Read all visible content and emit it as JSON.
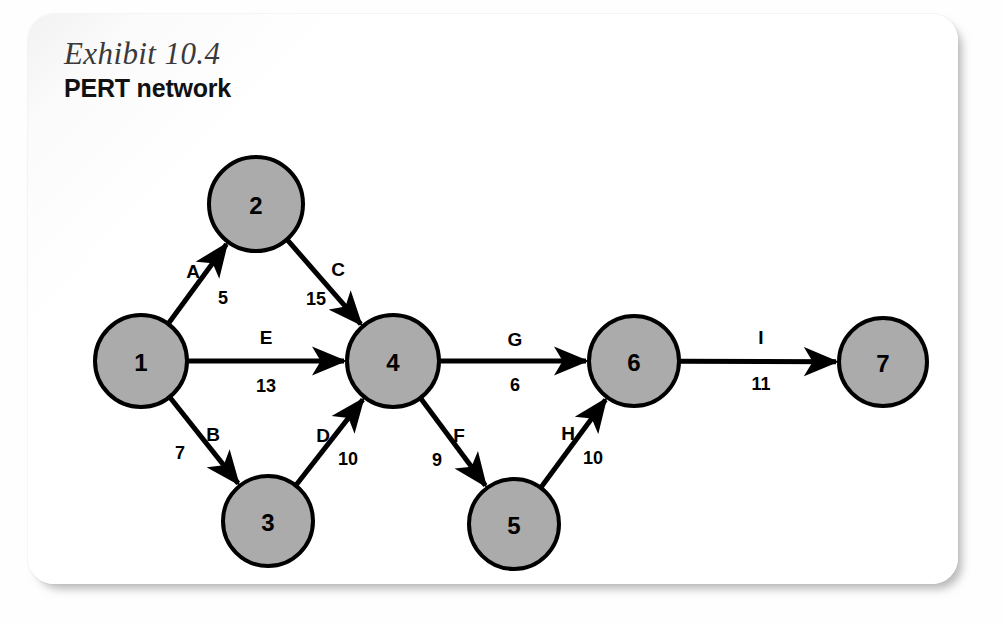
{
  "exhibit": {
    "number_label": "Exhibit 10.4",
    "title": "PERT network"
  },
  "colors": {
    "node_fill": "#ababab",
    "node_stroke": "#000000",
    "edge_stroke": "#000000",
    "panel_background": "#ffffff",
    "text": "#000000",
    "exhibit_label_text": "#3a3a3a"
  },
  "chart_data": {
    "type": "diagram",
    "subtype": "pert-network",
    "title": "PERT network",
    "nodes": [
      {
        "id": "1",
        "label": "1",
        "cx": 113,
        "cy": 347,
        "r": 46
      },
      {
        "id": "2",
        "label": "2",
        "cx": 228,
        "cy": 190,
        "r": 47
      },
      {
        "id": "3",
        "label": "3",
        "cx": 240,
        "cy": 507,
        "r": 45
      },
      {
        "id": "4",
        "label": "4",
        "cx": 365,
        "cy": 347,
        "r": 46
      },
      {
        "id": "5",
        "label": "5",
        "cx": 486,
        "cy": 510,
        "r": 45
      },
      {
        "id": "6",
        "label": "6",
        "cx": 606,
        "cy": 347,
        "r": 45
      },
      {
        "id": "7",
        "label": "7",
        "cx": 855,
        "cy": 348,
        "r": 44
      }
    ],
    "edges": [
      {
        "activity": "A",
        "duration": "5",
        "from": "1",
        "to": "2",
        "activity_pos": {
          "x": 165,
          "y": 257
        },
        "duration_pos": {
          "x": 195,
          "y": 284
        }
      },
      {
        "activity": "C",
        "duration": "15",
        "from": "2",
        "to": "4",
        "activity_pos": {
          "x": 310,
          "y": 255
        },
        "duration_pos": {
          "x": 288,
          "y": 285
        }
      },
      {
        "activity": "E",
        "duration": "13",
        "from": "1",
        "to": "4",
        "activity_pos": {
          "x": 238,
          "y": 323
        },
        "duration_pos": {
          "x": 238,
          "y": 372
        }
      },
      {
        "activity": "B",
        "duration": "7",
        "from": "1",
        "to": "3",
        "activity_pos": {
          "x": 185,
          "y": 420
        },
        "duration_pos": {
          "x": 152,
          "y": 439
        }
      },
      {
        "activity": "D",
        "duration": "10",
        "from": "3",
        "to": "4",
        "activity_pos": {
          "x": 295,
          "y": 421
        },
        "duration_pos": {
          "x": 320,
          "y": 445
        }
      },
      {
        "activity": "F",
        "duration": "9",
        "from": "4",
        "to": "5",
        "activity_pos": {
          "x": 431,
          "y": 421
        },
        "duration_pos": {
          "x": 409,
          "y": 446
        }
      },
      {
        "activity": "H",
        "duration": "10",
        "from": "5",
        "to": "6",
        "activity_pos": {
          "x": 540,
          "y": 419
        },
        "duration_pos": {
          "x": 565,
          "y": 444
        }
      },
      {
        "activity": "G",
        "duration": "6",
        "from": "4",
        "to": "6",
        "activity_pos": {
          "x": 487,
          "y": 325
        },
        "duration_pos": {
          "x": 487,
          "y": 371
        }
      },
      {
        "activity": "I",
        "duration": "11",
        "from": "6",
        "to": "7",
        "activity_pos": {
          "x": 733,
          "y": 323
        },
        "duration_pos": {
          "x": 733,
          "y": 370
        }
      }
    ],
    "node_count": 7,
    "edge_count": 9,
    "legend": "Nodes are numbered events; arrows are activities labeled with a letter and a duration."
  }
}
